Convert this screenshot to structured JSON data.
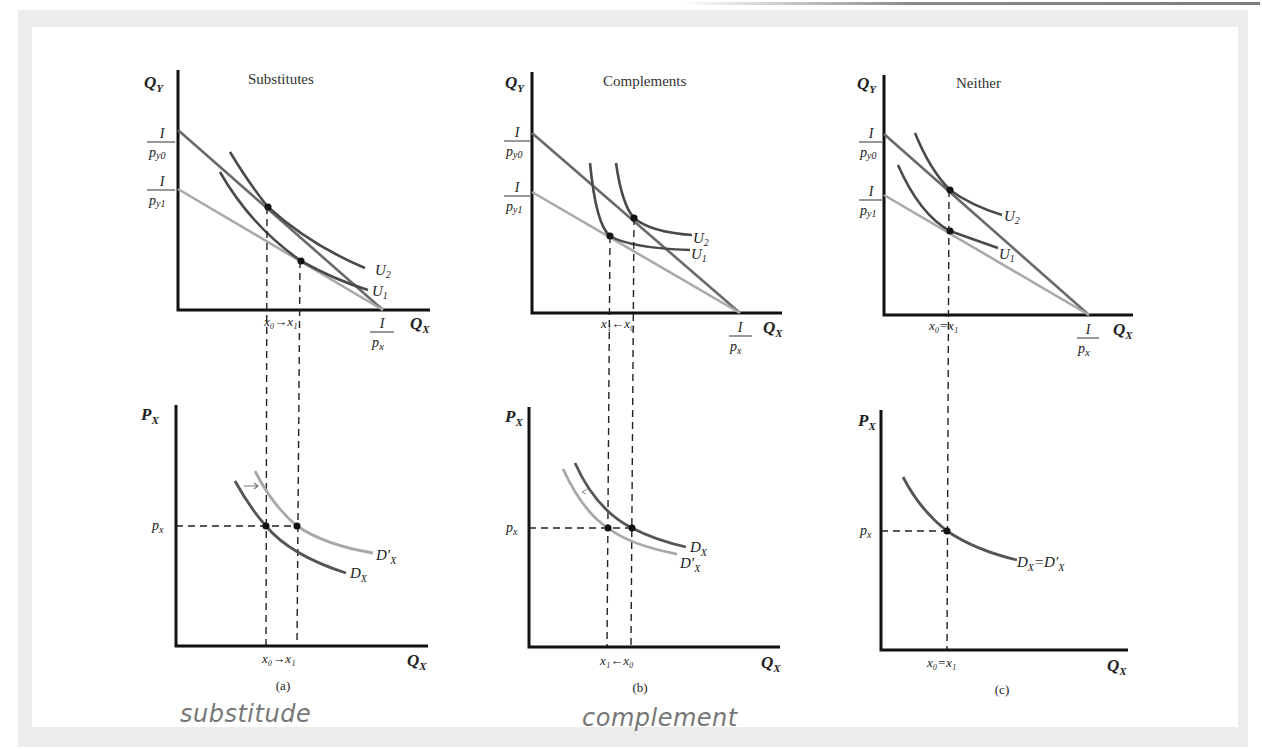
{
  "figure": {
    "panels": [
      {
        "id": "a",
        "title": "Substitutes",
        "caption": "(a)",
        "top": {
          "y_axis_label": "Q",
          "y_axis_sub": "Y",
          "x_axis_label": "Q",
          "x_axis_sub": "X",
          "intercept_y0_num": "I",
          "intercept_y0_den": "p",
          "intercept_y0_den_sub": "y0",
          "intercept_y1_num": "I",
          "intercept_y1_den": "p",
          "intercept_y1_den_sub": "y1",
          "intercept_x_num": "I",
          "intercept_x_den": "p",
          "intercept_x_den_sub": "x",
          "curve_u2": "U",
          "curve_u2_sub": "2",
          "curve_u1": "U",
          "curve_u1_sub": "1",
          "tick_label": "x₀→x₁"
        },
        "bottom": {
          "y_axis_label": "P",
          "y_axis_sub": "X",
          "x_axis_label": "Q",
          "x_axis_sub": "X",
          "price_label": "p",
          "price_sub": "x",
          "curve_d": "D",
          "curve_d_sub": "X",
          "curve_dprime": "D′",
          "curve_dprime_sub": "X",
          "tick_label": "x₀→x₁"
        }
      },
      {
        "id": "b",
        "title": "Complements",
        "caption": "(b)",
        "top": {
          "y_axis_label": "Q",
          "y_axis_sub": "Y",
          "x_axis_label": "Q",
          "x_axis_sub": "X",
          "intercept_y0_num": "I",
          "intercept_y0_den": "p",
          "intercept_y0_den_sub": "y0",
          "intercept_y1_num": "I",
          "intercept_y1_den": "p",
          "intercept_y1_den_sub": "y1",
          "intercept_x_num": "I",
          "intercept_x_den": "p",
          "intercept_x_den_sub": "x",
          "curve_u2": "U",
          "curve_u2_sub": "2",
          "curve_u1": "U",
          "curve_u1_sub": "1",
          "tick_label": "x₁←x₀"
        },
        "bottom": {
          "y_axis_label": "P",
          "y_axis_sub": "X",
          "x_axis_label": "Q",
          "x_axis_sub": "X",
          "price_label": "p",
          "price_sub": "x",
          "curve_d": "D",
          "curve_d_sub": "X",
          "curve_dprime": "D′",
          "curve_dprime_sub": "X",
          "tick_label": "x₁←x₀"
        }
      },
      {
        "id": "c",
        "title": "Neither",
        "caption": "(c)",
        "top": {
          "y_axis_label": "Q",
          "y_axis_sub": "Y",
          "x_axis_label": "Q",
          "x_axis_sub": "X",
          "intercept_y0_num": "I",
          "intercept_y0_den": "p",
          "intercept_y0_den_sub": "y0",
          "intercept_y1_num": "I",
          "intercept_y1_den": "p",
          "intercept_y1_den_sub": "y1",
          "intercept_x_num": "I",
          "intercept_x_den": "p",
          "intercept_x_den_sub": "x",
          "curve_u2": "U",
          "curve_u2_sub": "2",
          "curve_u1": "U",
          "curve_u1_sub": "1",
          "tick_label": "x₀=x₁"
        },
        "bottom": {
          "y_axis_label": "P",
          "y_axis_sub": "X",
          "x_axis_label": "Q",
          "x_axis_sub": "X",
          "price_label": "p",
          "price_sub": "x",
          "curve_label": "D",
          "curve_label_sub": "X",
          "curve_label_eq": "=D′",
          "curve_label_eq_sub": "X",
          "tick_label": "x₀=x₁"
        }
      }
    ],
    "handwritten_notes": [
      "substitude",
      "complement"
    ],
    "colors": {
      "background_frame": "#ececec",
      "axis": "#111111",
      "budget_line_original": "#6a6a6a",
      "budget_line_new": "#a9a9a9",
      "indifference_curves": "#4a4a4a",
      "demand_original": "#555555",
      "demand_shifted": "#a8a8a8",
      "handwriting": "#777777"
    }
  }
}
